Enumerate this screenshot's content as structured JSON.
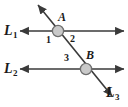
{
  "figure": {
    "width": 128,
    "height": 107,
    "background_color": "#ffffff",
    "line_color": "#3a3a3a",
    "vertex_fill_color": "#c9c9c9",
    "vertex_stroke_color": "#6e6e6e",
    "text_color": "#1a1a1a",
    "lines": [
      {
        "name": "L1",
        "label": "L",
        "subscript": "1",
        "kind": "horizontal",
        "x1": 20,
        "y1": 31,
        "x2": 124,
        "y2": 31,
        "arrows": "both"
      },
      {
        "name": "L2",
        "label": "L",
        "subscript": "2",
        "kind": "horizontal",
        "x1": 20,
        "y1": 69,
        "x2": 124,
        "y2": 69,
        "arrows": "both"
      },
      {
        "name": "L3",
        "label": "L",
        "subscript": "3",
        "kind": "transversal",
        "x1": 38,
        "y1": 5,
        "x2": 112,
        "y2": 96,
        "arrows": "both"
      }
    ],
    "vertices": [
      {
        "name": "A",
        "label": "A",
        "cx": 58,
        "cy": 31,
        "r": 6
      },
      {
        "name": "B",
        "label": "B",
        "cx": 86,
        "cy": 69,
        "r": 6
      }
    ],
    "angles": [
      {
        "name": "angle-1",
        "label": "1",
        "at_vertex": "A",
        "position": "below-left"
      },
      {
        "name": "angle-2",
        "label": "2",
        "at_vertex": "A",
        "position": "below-right"
      },
      {
        "name": "angle-3",
        "label": "3",
        "at_vertex": "B",
        "position": "above-left"
      }
    ]
  }
}
